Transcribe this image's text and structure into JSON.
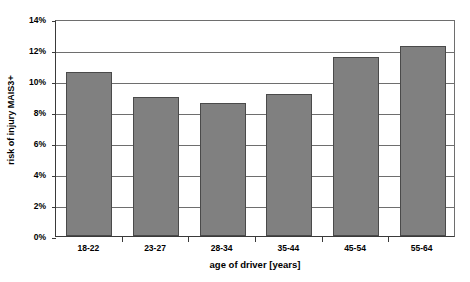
{
  "chart_data": {
    "type": "bar",
    "title": "",
    "subtitle": "",
    "xlabel": "age of driver [years]",
    "ylabel": "risk of injury MAIS3+",
    "categories": [
      "18-22",
      "23-27",
      "28-34",
      "35-44",
      "45-54",
      "55-64"
    ],
    "values": [
      10.55,
      8.95,
      8.55,
      9.15,
      11.55,
      12.25
    ],
    "value_labels": [
      "10.55%",
      "8.95%",
      "8.55%",
      "9.15%",
      "11.55%",
      "12.25%"
    ],
    "ylim": [
      0,
      14
    ],
    "ytick_values": [
      0,
      2,
      4,
      6,
      8,
      10,
      12,
      14
    ],
    "ytick_labels": [
      "0%",
      "2%",
      "4%",
      "6%",
      "8%",
      "10%",
      "12%",
      "14%"
    ],
    "grid": true,
    "grid_axis": "y",
    "legend": false,
    "legend_position": "none",
    "series": [
      {
        "name": "risk of injury MAIS3+",
        "values": [
          10.55,
          8.95,
          8.55,
          9.15,
          11.55,
          12.25
        ]
      }
    ],
    "colors": {
      "bar_fill": "#808080",
      "bar_border": "#4a4a4a",
      "gridline": "#6e6e6e",
      "axis": "#3a3a3a",
      "background": "#ffffff",
      "text": "#000000"
    }
  }
}
